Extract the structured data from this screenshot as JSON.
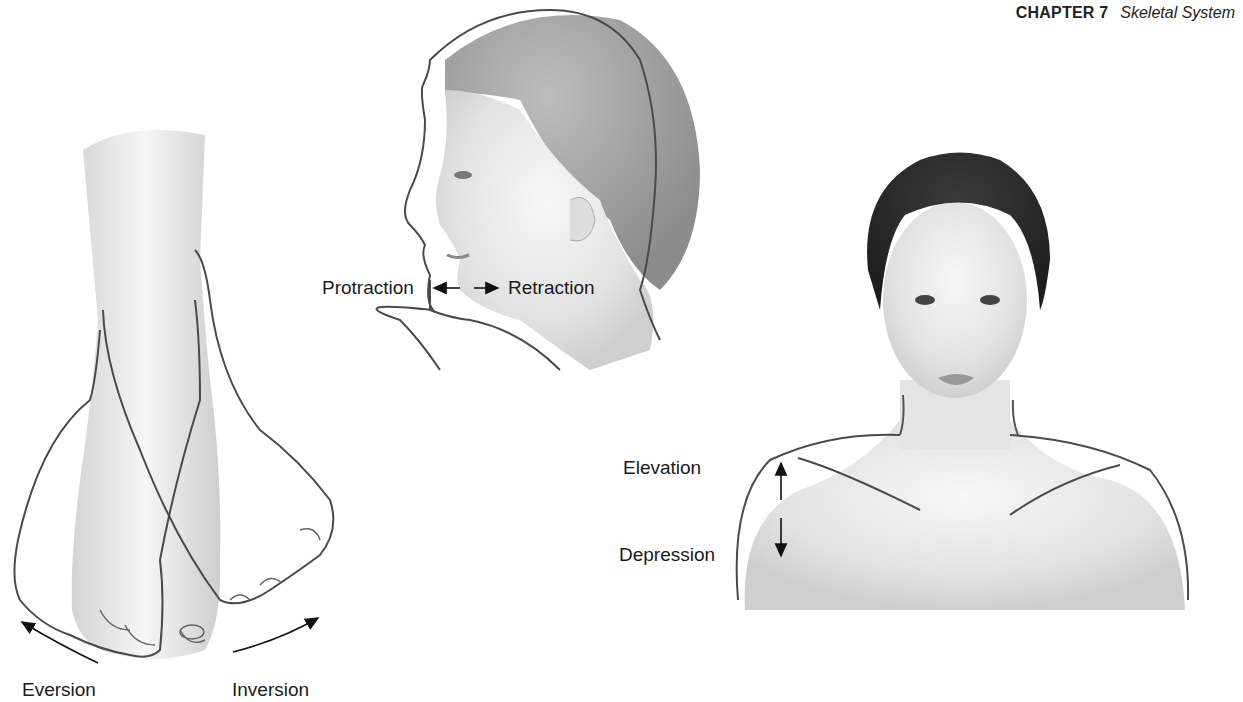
{
  "header": {
    "chapter": "CHAPTER 7",
    "section": "Skeletal System"
  },
  "figures": {
    "foot": {
      "labels": {
        "left": "Eversion",
        "right": "Inversion"
      },
      "icons": [
        "curved-arrow-left-icon",
        "curved-arrow-right-icon"
      ]
    },
    "head_profile": {
      "labels": {
        "left": "Protraction",
        "right": "Retraction"
      },
      "icons": [
        "arrow-left-icon",
        "arrow-right-icon"
      ]
    },
    "shoulders": {
      "labels": {
        "top": "Elevation",
        "bottom": "Depression"
      },
      "icons": [
        "double-vertical-arrow-icon"
      ]
    }
  },
  "colors": {
    "outline": "#4a4a4a",
    "skin_shade": "#d9d9d9",
    "hair_light": "#9a9a9a",
    "hair_dark": "#2b2b2b"
  }
}
